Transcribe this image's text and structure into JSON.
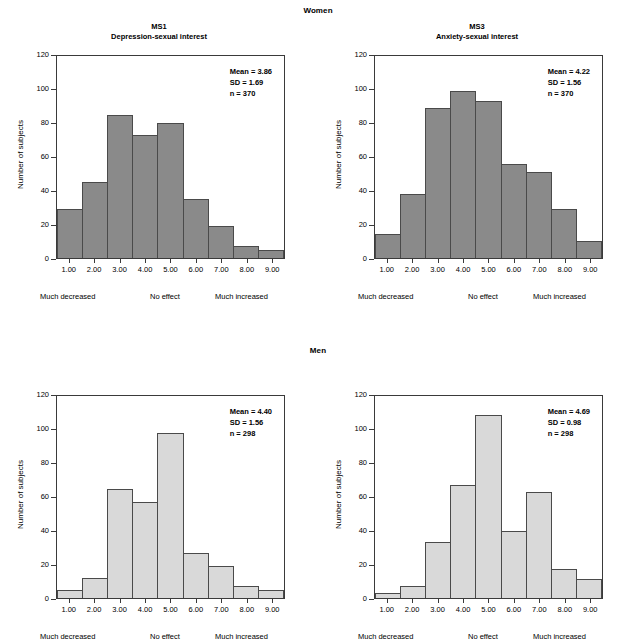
{
  "groups": {
    "women_label": "Women",
    "men_label": "Men"
  },
  "axis": {
    "ylabel": "Number of subjects",
    "yticks": [
      "0",
      "20",
      "40",
      "60",
      "80",
      "100",
      "120"
    ],
    "ymax": 120,
    "xticks": [
      "1.00",
      "2.00",
      "3.00",
      "4.00",
      "5.00",
      "6.00",
      "7.00",
      "8.00",
      "9.00"
    ],
    "anchor_low": "Much decreased",
    "anchor_mid": "No effect",
    "anchor_high": "Much increased"
  },
  "colors": {
    "bar_women": "#8a8a8a",
    "bar_men": "#d9d9d9",
    "axis": "#3a3a3a"
  },
  "panels": [
    {
      "id": "tl",
      "group": "Women",
      "code": "MS1",
      "subtitle": "Depression-sexual interest",
      "stats": {
        "mean": "Mean = 3.86",
        "sd": "SD = 1.69",
        "n": "n = 370"
      }
    },
    {
      "id": "tr",
      "group": "Women",
      "code": "MS3",
      "subtitle": "Anxiety-sexual interest",
      "stats": {
        "mean": "Mean = 4.22",
        "sd": "SD = 1.56",
        "n": "n = 370"
      }
    },
    {
      "id": "bl",
      "group": "Men",
      "code": "",
      "subtitle": "",
      "stats": {
        "mean": "Mean = 4.40",
        "sd": "SD = 1.56",
        "n": "n = 298"
      }
    },
    {
      "id": "br",
      "group": "Men",
      "code": "",
      "subtitle": "",
      "stats": {
        "mean": "Mean = 4.69",
        "sd": "SD = 0.98",
        "n": "n = 298"
      }
    }
  ],
  "chart_data": [
    {
      "type": "bar",
      "title": "MS1 Depression-sexual interest (Women)",
      "xlabel": "",
      "ylabel": "Number of subjects",
      "categories": [
        "1.00",
        "2.00",
        "3.00",
        "4.00",
        "5.00",
        "6.00",
        "7.00",
        "8.00",
        "9.00"
      ],
      "values": [
        29,
        45,
        85,
        73,
        80,
        35,
        19,
        7,
        5
      ],
      "ylim": [
        0,
        120
      ],
      "grid": false,
      "legend": "none",
      "annotations": [
        "Mean = 3.86",
        "SD = 1.69",
        "n = 370"
      ]
    },
    {
      "type": "bar",
      "title": "MS3 Anxiety-sexual interest (Women)",
      "xlabel": "",
      "ylabel": "Number of subjects",
      "categories": [
        "1.00",
        "2.00",
        "3.00",
        "4.00",
        "5.00",
        "6.00",
        "7.00",
        "8.00",
        "9.00"
      ],
      "values": [
        14,
        38,
        89,
        99,
        93,
        56,
        51,
        29,
        10
      ],
      "ylim": [
        0,
        120
      ],
      "grid": false,
      "legend": "none",
      "annotations": [
        "Mean = 4.22",
        "SD = 1.56",
        "n = 370"
      ]
    },
    {
      "type": "bar",
      "title": "MS1 Depression-sexual interest (Men)",
      "xlabel": "",
      "ylabel": "Number of subjects",
      "categories": [
        "1.00",
        "2.00",
        "3.00",
        "4.00",
        "5.00",
        "6.00",
        "7.00",
        "8.00",
        "9.00"
      ],
      "values": [
        5,
        12,
        65,
        57,
        98,
        27,
        19,
        7,
        5
      ],
      "ylim": [
        0,
        120
      ],
      "grid": false,
      "legend": "none",
      "annotations": [
        "Mean = 4.40",
        "SD = 1.56",
        "n = 298"
      ]
    },
    {
      "type": "bar",
      "title": "MS3 Anxiety-sexual interest (Men)",
      "xlabel": "",
      "ylabel": "Number of subjects",
      "categories": [
        "1.00",
        "2.00",
        "3.00",
        "4.00",
        "5.00",
        "6.00",
        "7.00",
        "8.00",
        "9.00"
      ],
      "values": [
        3,
        7,
        33,
        67,
        109,
        40,
        63,
        17,
        11
      ],
      "ylim": [
        0,
        120
      ],
      "grid": false,
      "legend": "none",
      "annotations": [
        "Mean = 4.69",
        "SD = 0.98",
        "n = 298"
      ]
    }
  ]
}
